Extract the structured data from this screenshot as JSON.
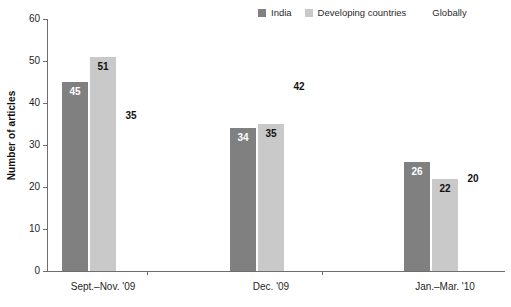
{
  "chart_data": {
    "type": "bar",
    "title": "",
    "subtitle": "",
    "xlabel": "",
    "ylabel": "Number of articles",
    "ylim": [
      0,
      60
    ],
    "ytick_step": 10,
    "yticks": [
      "60",
      "50",
      "40",
      "30",
      "20",
      "10",
      "0"
    ],
    "grid": false,
    "legend_position": "top-right",
    "categories": [
      "Sept.–Nov. '09",
      "Dec. '09",
      "Jan.–Mar. '10"
    ],
    "series": [
      {
        "name": "India",
        "color": "#808080",
        "label_color": "#ffffff",
        "values": [
          45,
          51,
          35
        ]
      },
      {
        "name": "Developing countries",
        "color": "#c9c9c9",
        "label_color": "#111111",
        "values": [
          34,
          35,
          42
        ]
      },
      {
        "name": "Globally",
        "color": "#ffffff",
        "label_color": "#111111",
        "values": [
          26,
          22,
          20
        ]
      }
    ],
    "groups": [
      {
        "category": "Sept.–Nov. '09",
        "bars": [
          {
            "series": "India",
            "value": 45,
            "value_label": "45"
          },
          {
            "series": "Developing countries",
            "value": 51,
            "value_label": "51"
          },
          {
            "series": "Globally",
            "value": 35,
            "value_label": "35"
          }
        ]
      },
      {
        "category": "Dec. '09",
        "bars": [
          {
            "series": "India",
            "value": 34,
            "value_label": "34"
          },
          {
            "series": "Developing countries",
            "value": 35,
            "value_label": "35"
          },
          {
            "series": "Globally",
            "value": 42,
            "value_label": "42"
          }
        ]
      },
      {
        "category": "Jan.–Mar. '10",
        "bars": [
          {
            "series": "India",
            "value": 26,
            "value_label": "26"
          },
          {
            "series": "Developing countries",
            "value": 22,
            "value_label": "22"
          },
          {
            "series": "Globally",
            "value": 20,
            "value_label": "20"
          }
        ]
      }
    ]
  },
  "legend": {
    "items": [
      {
        "label": "India",
        "color": "#808080"
      },
      {
        "label": "Developing countries",
        "color": "#c9c9c9"
      },
      {
        "label": "Globally",
        "color": "#ffffff"
      }
    ]
  },
  "axis": {
    "y_title": "Number of articles",
    "y_ticks": [
      "60",
      "50",
      "40",
      "30",
      "20",
      "10",
      "0"
    ],
    "x_labels": [
      "Sept.–Nov. '09",
      "Dec. '09",
      "Jan.–Mar. '10"
    ]
  }
}
